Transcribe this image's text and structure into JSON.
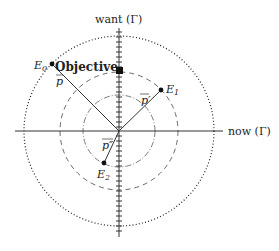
{
  "diagram": {
    "axes": {
      "vertical_label": "want (Γ)",
      "horizontal_label": "now (Γ)"
    },
    "points": {
      "e0": "E",
      "e0_sub": "0",
      "e1": "E",
      "e1_sub": "1",
      "e2": "E",
      "e2_sub": "2"
    },
    "objective_label": "Objective",
    "vector_labels": {
      "p": "p",
      "p_prime": "p′",
      "p_double_prime": "p″"
    }
  }
}
